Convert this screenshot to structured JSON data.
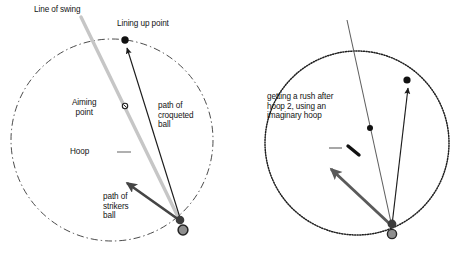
{
  "figure": {
    "background_color": "#ffffff",
    "ink_color": "#141414",
    "grey_color": "#9d9d9d",
    "dark_grey_color": "#5a5a5a"
  },
  "left_diagram": {
    "name": "lining-up-the-croquet-shot",
    "circle": {
      "cx": 112,
      "cy": 140,
      "r": 101,
      "stroke_style": "dash-dot",
      "stroke_color": "#2b2b2b"
    },
    "labels": {
      "line_of_swing": "Line of swing",
      "lining_up_point": "Lining up point",
      "aiming_point": "Aiming\npoint",
      "hoop": "Hoop",
      "path_of_croqueted_ball": "path of\ncroqueted\nball",
      "path_of_strikers_ball": "path of\nstrikers\nball"
    },
    "markers": {
      "lining_up_point": {
        "x": 125,
        "y": 40,
        "r": 3.6,
        "color": "#111111"
      },
      "aiming_point": {
        "x": 125,
        "y": 106,
        "r": 2.6,
        "color": "#111111"
      },
      "hoop_legend_dash": {
        "x1": 117,
        "y1": 152,
        "x2": 130,
        "y2": 152,
        "color": "#9d9d9d"
      },
      "ball_striker": {
        "x": 180,
        "y": 220,
        "r": 4.2,
        "color": "#3a3a3a"
      },
      "ball_croqueted": {
        "x": 183,
        "y": 230,
        "r": 5.0,
        "color": "#8e8e8e",
        "ring": "#2a2a2a"
      }
    },
    "lines": {
      "line_of_swing": {
        "x1": 81,
        "y1": 17,
        "x2": 180,
        "y2": 222,
        "color": "#c4c4c4",
        "width": 3.2
      },
      "path_of_croqueted_ball": {
        "x1": 181,
        "y1": 221,
        "x2": 126,
        "y2": 46,
        "color": "#1c1c1c",
        "width": 1.2,
        "arrow": true
      },
      "path_of_strikers_ball": {
        "x1": 182,
        "y1": 222,
        "x2": 126,
        "y2": 182,
        "color": "#454545",
        "width": 2.6,
        "arrow": true
      }
    }
  },
  "right_diagram": {
    "name": "rush-after-hoop-2-imaginary-hoop",
    "circle": {
      "cx": 357,
      "cy": 143,
      "r": 92,
      "stroke_style": "dotted",
      "stroke_color": "#1f1f1f"
    },
    "labels": {
      "caption": "getting a rush after\nhoop 2, using an\nimaginary hoop"
    },
    "markers": {
      "target_point_on_circle": {
        "x": 407,
        "y": 80,
        "r": 3.6,
        "color": "#111111"
      },
      "aiming_point": {
        "x": 370,
        "y": 128,
        "r": 3.0,
        "color": "#111111"
      },
      "hoop_legend_dash": {
        "x1": 329,
        "y1": 148,
        "x2": 342,
        "y2": 148,
        "color": "#9d9d9d"
      },
      "imaginary_hoop_dash": {
        "x1": 348,
        "y1": 146,
        "x2": 359,
        "y2": 155,
        "color": "#111111"
      },
      "ball_striker": {
        "x": 392,
        "y": 224,
        "r": 4.4,
        "color": "#3a3a3a"
      },
      "ball_croqueted": {
        "x": 392,
        "y": 234,
        "r": 4.6,
        "color": "#8e8e8e",
        "ring": "#2a2a2a"
      }
    },
    "lines": {
      "line_of_swing": {
        "x1": 347,
        "y1": 20,
        "x2": 392,
        "y2": 226,
        "color": "#5f5f5f",
        "width": 1.1
      },
      "path_of_croqueted_ball": {
        "x1": 392,
        "y1": 225,
        "x2": 408,
        "y2": 86,
        "color": "#1c1c1c",
        "width": 1.2,
        "arrow": true
      },
      "path_of_strikers_ball": {
        "x1": 392,
        "y1": 226,
        "x2": 330,
        "y2": 168,
        "color": "#5a5a5a",
        "width": 2.8,
        "arrow": true
      }
    }
  }
}
